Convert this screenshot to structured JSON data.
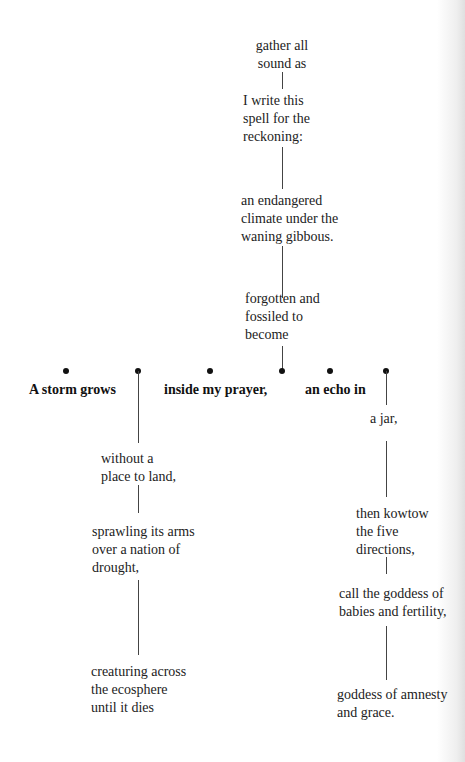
{
  "poem": {
    "trunk": [
      {
        "text": "gather all\nsound as"
      },
      {
        "text": "I write this\nspell for the\nreckoning:"
      },
      {
        "text": "an endangered\nclimate under the\nwaning gibbous."
      },
      {
        "text": "forgotten and\nfossiled to\nbecome"
      }
    ],
    "branch_row": [
      {
        "text": "A storm grows"
      },
      {
        "text": "inside my prayer,"
      },
      {
        "text": "an echo in"
      }
    ],
    "left_column": [
      {
        "text": "without a\nplace to land,"
      },
      {
        "text": "sprawling its arms\nover a nation of\ndrought,"
      },
      {
        "text": "creaturing across\nthe ecosphere\nuntil it dies"
      }
    ],
    "right_column": [
      {
        "text": "a jar,"
      },
      {
        "text": "then kowtow\nthe five\ndirections,"
      },
      {
        "text": "call the goddess of\nbabies and fertility,"
      },
      {
        "text": "goddess of amnesty\nand grace."
      }
    ]
  },
  "colors": {
    "background": "#ffffff",
    "text": "#222222",
    "line": "#444444",
    "dot": "#111111"
  }
}
